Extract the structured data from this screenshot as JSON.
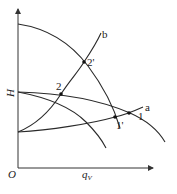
{
  "diagram": {
    "axes": {
      "origin_label": "O",
      "y_label": "H",
      "x_label": "q",
      "x_label_subscript": "V"
    },
    "curves": [
      {
        "id": "pump-curve-upper",
        "label": ""
      },
      {
        "id": "pump-curve-middle",
        "label": ""
      },
      {
        "id": "pump-curve-lower",
        "label": ""
      },
      {
        "id": "system-curve-a",
        "label": "a"
      },
      {
        "id": "system-curve-b",
        "label": "b"
      }
    ],
    "points": [
      {
        "id": "point-1",
        "label": "1"
      },
      {
        "id": "point-1-prime",
        "label": "1'"
      },
      {
        "id": "point-2",
        "label": "2"
      },
      {
        "id": "point-2-prime",
        "label": "2'"
      }
    ],
    "colors": {
      "line": "#2a2a2a",
      "background": "#ffffff"
    }
  }
}
